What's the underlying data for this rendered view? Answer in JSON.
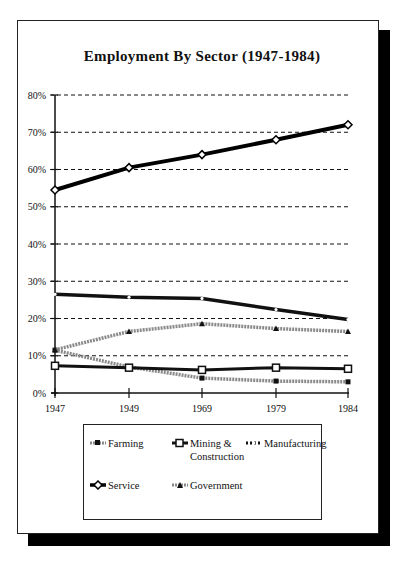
{
  "chart_data": {
    "type": "line",
    "title": "Employment By Sector (1947-1984)",
    "xlabel": "",
    "ylabel": "",
    "categories": [
      "1947",
      "1949",
      "1969",
      "1979",
      "1984"
    ],
    "ylim": [
      0,
      80
    ],
    "yticks": [
      "0%",
      "10%",
      "20%",
      "30%",
      "40%",
      "50%",
      "60%",
      "70%",
      "80%"
    ],
    "grid": true,
    "legend_position": "bottom",
    "series": [
      {
        "name": "Farming",
        "values": [
          11.5,
          7.0,
          4.0,
          3.2,
          3.0
        ],
        "color": "#8a8a8a",
        "marker": "filled-square"
      },
      {
        "name": "Mining & Construction",
        "values": [
          7.3,
          6.8,
          6.2,
          6.8,
          6.5
        ],
        "color": "#111111",
        "marker": "hollow-square"
      },
      {
        "name": "Manufacturing",
        "values": [
          26.5,
          25.7,
          25.4,
          22.4,
          19.7
        ],
        "color": "#111111",
        "marker": "dot"
      },
      {
        "name": "Service",
        "values": [
          54.5,
          60.5,
          64.0,
          68.0,
          72.0
        ],
        "color": "#000000",
        "marker": "hollow-diamond"
      },
      {
        "name": "Government",
        "values": [
          11.6,
          16.5,
          18.6,
          17.3,
          16.5
        ],
        "color": "#8a8a8a",
        "marker": "triangle"
      }
    ]
  },
  "legend": {
    "farming": "Farming",
    "mining_line1": "Mining &",
    "mining_line2": "Construction",
    "manufacturing": "Manufacturing",
    "service": "Service",
    "government": "Government"
  }
}
